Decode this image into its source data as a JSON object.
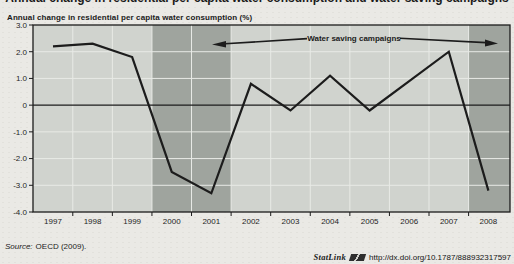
{
  "header": {
    "cropped_title": "Annual change in residential per capita water consumption and water saving campaigns"
  },
  "chart_data": {
    "type": "line",
    "title": "Annual change in residential per capita water consumption (%)",
    "x": [
      1997,
      1998,
      1999,
      2000,
      2001,
      2002,
      2003,
      2004,
      2005,
      2006,
      2007,
      2008
    ],
    "x_tick_labels": [
      "1997",
      "1998",
      "1999",
      "2000",
      "2001",
      "2002",
      "2003",
      "2004",
      "2005",
      "2006",
      "2007",
      "2008"
    ],
    "values": [
      2.2,
      2.3,
      1.8,
      -2.5,
      -3.3,
      0.8,
      -0.2,
      1.1,
      -0.2,
      0.9,
      2.0,
      -3.2
    ],
    "ylim": [
      -4,
      3
    ],
    "yticks": [
      3,
      2,
      1,
      0,
      -1,
      -2,
      -3,
      -4
    ],
    "ytick_labels": [
      "3.0",
      "2.0",
      "1.0",
      "0",
      "-1.0",
      "-2.0",
      "-3.0",
      "-4.0"
    ],
    "grid": true,
    "legend": "none",
    "annotation": "Water saving campaigns",
    "campaign_bands_years": [
      [
        1999.5,
        2001.5
      ],
      [
        2007.5,
        2008.6
      ]
    ],
    "colors": {
      "line": "#1c1c1c",
      "plot_bg": "#d0d3ce",
      "band": "#9fa49e",
      "grid": "#e8eae6",
      "text": "#1f1f1f",
      "page_bg": "#eae9e5"
    }
  },
  "footer": {
    "source_label": "Source:",
    "source_text": "OECD (2009).",
    "statlink_label": "StatLink",
    "statlink_url": "http://dx.doi.org/10.1787/888932317597"
  }
}
